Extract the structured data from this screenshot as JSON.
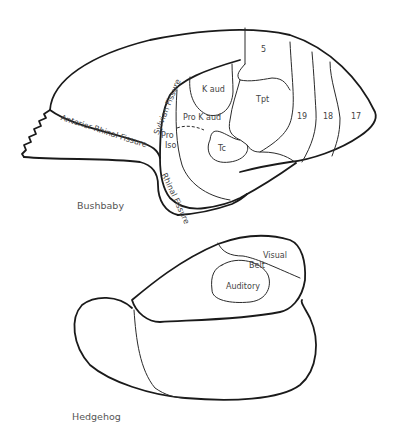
{
  "figure": {
    "panels": [
      {
        "caption": "Bushbaby",
        "regions": {
          "area_5": "5",
          "kaud": "K aud",
          "tpt": "Tpt",
          "prokaud": "Pro K aud",
          "proiso_1": "Pro",
          "proiso_2": "Iso",
          "tc": "Tc",
          "area_19": "19",
          "area_18": "18",
          "area_17": "17"
        },
        "fissures": {
          "anterior_rhinal": "Anterior Rhinal Fissure",
          "sylvian": "Sylvian Fissure",
          "rhinal": "Rhinal Fissure"
        }
      },
      {
        "caption": "Hedgehog",
        "regions": {
          "visual": "Visual",
          "belt": "Belt",
          "auditory": "Auditory"
        }
      }
    ]
  }
}
